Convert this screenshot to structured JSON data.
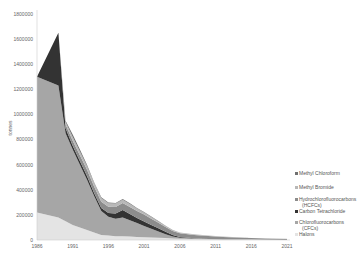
{
  "chart_data": {
    "type": "area",
    "stacked": true,
    "title": "",
    "xlabel": "",
    "ylabel": "tonnes",
    "ylim": [
      0,
      1800000
    ],
    "yticks": [
      0,
      200000,
      400000,
      600000,
      800000,
      1000000,
      1200000,
      1400000,
      1600000,
      1800000
    ],
    "xticks": [
      1986,
      1991,
      1996,
      2001,
      2006,
      2011,
      2016,
      2021
    ],
    "xlim": [
      1986,
      2021
    ],
    "grid": false,
    "legend_position": "right-bottom",
    "x": [
      1986,
      1989,
      1990,
      1991,
      1992,
      1993,
      1994,
      1995,
      1996,
      1997,
      1998,
      1999,
      2000,
      2001,
      2002,
      2003,
      2004,
      2005,
      2006,
      2008,
      2010,
      2012,
      2014,
      2016,
      2018,
      2021
    ],
    "series": [
      {
        "name": "Halons",
        "color": "#e4e4e4",
        "values": [
          220000,
          180000,
          150000,
          120000,
          100000,
          80000,
          60000,
          40000,
          35000,
          30000,
          30000,
          28000,
          25000,
          22000,
          20000,
          18000,
          15000,
          12000,
          10000,
          8000,
          6000,
          5000,
          4000,
          3000,
          2000,
          1000
        ]
      },
      {
        "name": "Chlorofluorocarbons (CFCs)",
        "color": "#a6a6a6",
        "values": [
          1080000,
          1050000,
          700000,
          600000,
          500000,
          400000,
          290000,
          190000,
          150000,
          140000,
          150000,
          130000,
          110000,
          90000,
          70000,
          50000,
          30000,
          15000,
          8000,
          3000,
          1000,
          0,
          0,
          0,
          0,
          0
        ]
      },
      {
        "name": "Carbon Tetrachloride",
        "color": "#333333",
        "values": [
          0,
          420000,
          40000,
          30000,
          30000,
          30000,
          25000,
          25000,
          30000,
          40000,
          60000,
          50000,
          40000,
          35000,
          30000,
          25000,
          20000,
          12000,
          6000,
          3000,
          1000,
          0,
          0,
          0,
          0,
          0
        ]
      },
      {
        "name": "Hydrochlorofluorocarbons (HCFCs)",
        "color": "#8c8c8c",
        "values": [
          0,
          0,
          30000,
          40000,
          45000,
          50000,
          50000,
          50000,
          50000,
          52000,
          55000,
          55000,
          55000,
          55000,
          50000,
          45000,
          38000,
          33000,
          30000,
          27000,
          24000,
          20000,
          16000,
          12000,
          10000,
          8000
        ]
      },
      {
        "name": "Methyl Bromide",
        "color": "#b8b8b8",
        "values": [
          0,
          0,
          20000,
          30000,
          30000,
          30000,
          30000,
          30000,
          28000,
          28000,
          26000,
          24000,
          20000,
          16000,
          12000,
          10000,
          8000,
          6000,
          5000,
          4000,
          3000,
          2000,
          2000,
          1000,
          1000,
          1000
        ]
      },
      {
        "name": "Methyl Chloroform",
        "color": "#707070",
        "values": [
          0,
          0,
          10000,
          20000,
          15000,
          10000,
          5000,
          5000,
          5000,
          5000,
          5000,
          5000,
          5000,
          5000,
          5000,
          3000,
          2000,
          1000,
          1000,
          0,
          0,
          0,
          0,
          0,
          0,
          0
        ]
      }
    ]
  },
  "axis": {
    "y_label": "tonnes",
    "y_tick_labels": [
      "0",
      "200000",
      "400000",
      "600000",
      "800000",
      "1000000",
      "1200000",
      "1400000",
      "1600000",
      "1800000"
    ],
    "x_tick_labels": [
      "1986",
      "1991",
      "1996",
      "2001",
      "2006",
      "2011",
      "2016",
      "2021"
    ]
  },
  "legend": {
    "items": [
      {
        "label": "Methyl Chloroform",
        "lines": [
          "Methyl Chloroform"
        ],
        "color": "#707070"
      },
      {
        "label": "Methyl Bromide",
        "lines": [
          "Methyl Bromide"
        ],
        "color": "#b8b8b8"
      },
      {
        "label": "Hydrochlorofluorocarbons (HCFCs)",
        "lines": [
          "Hydrochlorofluorocarbons",
          "(HCFCs)"
        ],
        "color": "#8c8c8c"
      },
      {
        "label": "Carbon Tetrachloride",
        "lines": [
          "Carbon Tetrachloride"
        ],
        "color": "#333333"
      },
      {
        "label": "Chlorofluorocarbons (CFCs)",
        "lines": [
          "Chlorofluorocarbons",
          "(CFCs)"
        ],
        "color": "#a6a6a6"
      },
      {
        "label": "Halons",
        "lines": [
          "Halons"
        ],
        "color": "#e4e4e4"
      }
    ]
  }
}
